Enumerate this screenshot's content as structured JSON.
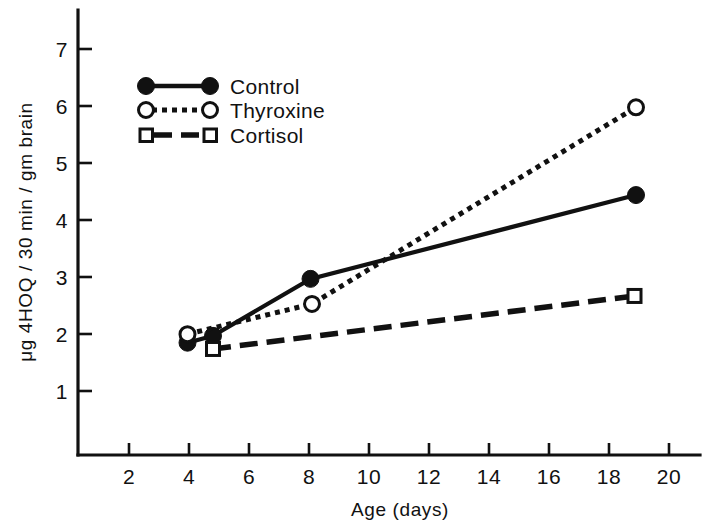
{
  "chart_data": {
    "type": "line",
    "title": "",
    "xlabel": "Age (days)",
    "ylabel": "μg 4HOQ / 30 min / gm brain",
    "xlim": [
      0,
      21
    ],
    "ylim": [
      0,
      7.6
    ],
    "grid": false,
    "legend_position": "upper-left-inside",
    "xticks": [
      2,
      4,
      6,
      8,
      10,
      12,
      14,
      16,
      18,
      20
    ],
    "xtick_labels": [
      "2",
      "4",
      "6",
      "8",
      "10",
      "12",
      "14",
      "16",
      "18",
      "20"
    ],
    "yticks": [
      1,
      2,
      3,
      4,
      5,
      6,
      7
    ],
    "ytick_labels": [
      "1",
      "2",
      "3",
      "4",
      "5",
      "6",
      "7"
    ],
    "series": [
      {
        "name": "Control",
        "marker": "filled-circle",
        "linestyle": "solid",
        "color": "#111111",
        "x": [
          3.95,
          4.8,
          8.05,
          18.9
        ],
        "y": [
          1.9,
          2.02,
          3.02,
          4.49
        ]
      },
      {
        "name": "Thyroxine",
        "marker": "open-circle",
        "linestyle": "dotted",
        "color": "#111111",
        "x": [
          3.95,
          8.1,
          18.9
        ],
        "y": [
          2.05,
          2.58,
          6.03
        ]
      },
      {
        "name": "Cortisol",
        "marker": "open-square",
        "linestyle": "dashed",
        "color": "#111111",
        "x": [
          4.8,
          18.85
        ],
        "y": [
          1.79,
          2.72
        ]
      }
    ]
  },
  "legend": {
    "items": [
      {
        "label": "Control"
      },
      {
        "label": "Thyroxine"
      },
      {
        "label": "Cortisol"
      }
    ]
  },
  "axes": {
    "x_title": "Age (days)",
    "y_title": "μg 4HOQ / 30 min / gm brain"
  }
}
